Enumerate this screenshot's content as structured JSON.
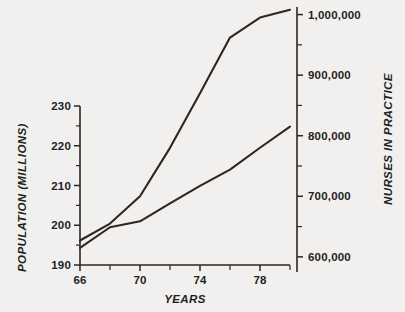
{
  "chart_data": {
    "type": "line",
    "title": "",
    "xlabel": "YEARS",
    "ylabel": "POPULATION (MILLIONS)",
    "y2label": "NURSES IN PRACTICE",
    "xlim": [
      66,
      80
    ],
    "ylim": [
      190,
      230
    ],
    "y2lim": [
      575000,
      1012500
    ],
    "grid": false,
    "legend": "none",
    "x_ticks": [
      66,
      70,
      74,
      78
    ],
    "x_tick_labels": [
      "66",
      "70",
      "74",
      "78"
    ],
    "x_minor_ticks": [
      68,
      72,
      76,
      80
    ],
    "y_ticks": [
      190,
      200,
      210,
      220,
      230
    ],
    "y_tick_labels": [
      "190",
      "200",
      "210",
      "220",
      "230"
    ],
    "y_minor_ticks": [
      195,
      205,
      215,
      225
    ],
    "y2_ticks": [
      600000,
      700000,
      800000,
      900000,
      1000000
    ],
    "y2_tick_labels": [
      "600,000",
      "700,000",
      "800,000",
      "900,000",
      "1,000,000"
    ],
    "y2_minor_ticks": [
      650000,
      750000,
      850000,
      950000
    ],
    "series": [
      {
        "name": "Population (millions)",
        "axis": "left",
        "color": "#2b2724",
        "x": [
          66,
          68,
          70,
          72,
          74,
          76,
          78,
          80
        ],
        "values": [
          194.3,
          199.5,
          201.0,
          205.5,
          209.9,
          214.0,
          219.5,
          224.8
        ]
      },
      {
        "name": "Nurses in practice",
        "axis": "right",
        "color": "#2b2724",
        "x": [
          66,
          68,
          70,
          72,
          74,
          76,
          78,
          80
        ],
        "values": [
          627000,
          655000,
          700000,
          780000,
          870000,
          962000,
          995000,
          1008000
        ]
      }
    ]
  },
  "labels": {
    "x_axis_title": "YEARS",
    "y_left_axis_title": "POPULATION (MILLIONS)",
    "y_right_axis_title": "NURSES IN PRACTICE"
  },
  "colors": {
    "background": "#f2f0ee",
    "ink": "#2b2724",
    "line": "#2b2724"
  }
}
